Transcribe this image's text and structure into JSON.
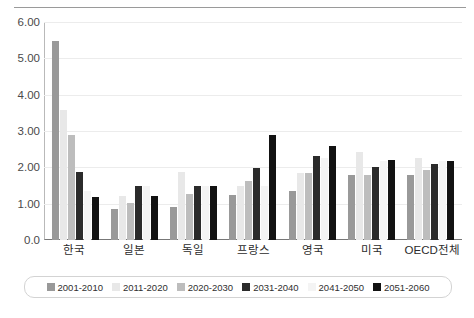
{
  "chart_data": {
    "type": "bar",
    "title": "",
    "subtitle": "",
    "xlabel": "",
    "ylabel": "",
    "ylim": [
      0,
      6
    ],
    "ytick_labels": [
      "6.00",
      "5.00",
      "4.00",
      "3.00",
      "2.00",
      "1.00",
      "0.0"
    ],
    "ytick_values": [
      6,
      5,
      4,
      3,
      2,
      1,
      0
    ],
    "grid": true,
    "legend_position": "bottom",
    "categories": [
      "한국",
      "일본",
      "독일",
      "프랑스",
      "영국",
      "미국",
      "OECD전체"
    ],
    "series": [
      {
        "name": "2001-2010",
        "color": "#999999",
        "values": [
          5.48,
          0.85,
          0.9,
          1.25,
          1.35,
          1.78,
          1.78
        ]
      },
      {
        "name": "2011-2020",
        "color": "#e8e8e8",
        "values": [
          3.58,
          1.22,
          1.88,
          1.5,
          1.85,
          2.42,
          2.25
        ]
      },
      {
        "name": "2020-2030",
        "color": "#bdbdbd",
        "values": [
          2.88,
          1.02,
          1.28,
          1.62,
          1.85,
          1.78,
          1.92
        ]
      },
      {
        "name": "2031-2040",
        "color": "#2b2b2b",
        "values": [
          1.88,
          1.5,
          1.5,
          1.98,
          2.3,
          2.02,
          2.08
        ]
      },
      {
        "name": "2041-2050",
        "color": "#f4f4f4",
        "values": [
          1.35,
          1.5,
          1.5,
          1.5,
          2.25,
          2.18,
          2.18
        ]
      },
      {
        "name": "2051-2060",
        "color": "#121212",
        "values": [
          1.18,
          1.22,
          1.5,
          2.88,
          2.58,
          2.2,
          2.18
        ]
      }
    ]
  }
}
